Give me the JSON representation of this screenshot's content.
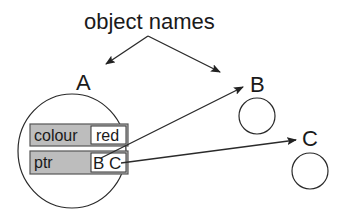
{
  "title": "object names",
  "objects": [
    {
      "name": "A"
    },
    {
      "name": "B"
    },
    {
      "name": "C"
    }
  ],
  "object_a": {
    "fields": [
      {
        "label": "colour",
        "value": "red"
      },
      {
        "label": "ptr",
        "value_b": "B",
        "value_c": "C"
      }
    ]
  },
  "colors": {
    "field_fill": "#bdbdbd",
    "line": "#2a2a2a"
  }
}
